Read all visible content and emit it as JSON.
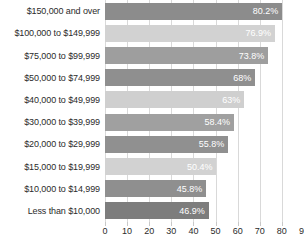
{
  "chart_data": {
    "type": "bar",
    "orientation": "horizontal",
    "title": "",
    "xlabel": "",
    "ylabel": "",
    "xlim": [
      0,
      90
    ],
    "grid": true,
    "legend": false,
    "xticks": [
      0,
      10,
      20,
      30,
      40,
      50,
      60,
      70,
      80,
      90
    ],
    "xtick_labels": [
      "0",
      "10",
      "20",
      "30",
      "40",
      "50",
      "60",
      "70",
      "80",
      "90"
    ],
    "categories": [
      "$150,000 and over",
      "$100,000 to $149,999",
      "$75,000 to $99,999",
      "$50,000 to $74,999",
      "$40,000 to $49,999",
      "$30,000 to $39,999",
      "$20,000 to $29,999",
      "$15,000 to $19,999",
      "$10,000 to $14,999",
      "Less than $10,000"
    ],
    "values": [
      80.2,
      76.9,
      73.8,
      68,
      63,
      58.4,
      55.8,
      50.4,
      45.8,
      46.9
    ],
    "data_labels": [
      "80.2%",
      "76.9%",
      "73.8%",
      "68%",
      "63%",
      "58.4%",
      "55.8%",
      "50.4%",
      "45.8%",
      "46.9%"
    ],
    "bar_colors": [
      "#8c8c8c",
      "#d2d2d2",
      "#9e9e9e",
      "#8f8f8f",
      "#cfcfcf",
      "#a0a0a0",
      "#909090",
      "#d2d2d2",
      "#8f8f8f",
      "#7d7d7d"
    ],
    "grid_color": "#d9d9d9",
    "label_color": "#ffffff",
    "background": "#ffffff"
  }
}
